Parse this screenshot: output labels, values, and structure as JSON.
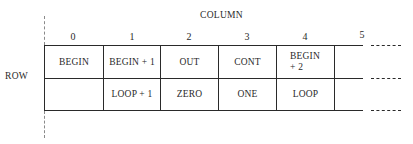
{
  "diagram": {
    "title": "COLUMN",
    "row_label": "ROW",
    "columns": [
      "0",
      "1",
      "2",
      "3",
      "4",
      "5"
    ],
    "rows": [
      [
        "BEGIN",
        "BEGIN + 1",
        "OUT",
        "CONT",
        "BEGIN",
        ""
      ],
      [
        "",
        "LOOP + 1",
        "ZERO",
        "ONE",
        "LOOP",
        ""
      ]
    ],
    "cell_0_4_line2": "+ 2",
    "line_color": "#2a2a2a"
  }
}
